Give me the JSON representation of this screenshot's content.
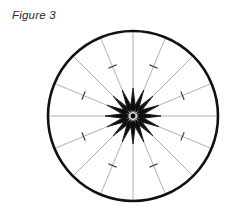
{
  "figure": {
    "caption": "Figure 3",
    "canvas": {
      "width": 236,
      "height": 219,
      "background": "#ffffff"
    },
    "circle": {
      "center_x": 133,
      "center_y": 116,
      "radius": 85,
      "stroke_color": "#101010",
      "stroke_width": 2.6,
      "fill": "none"
    },
    "spokes": {
      "count": 16,
      "angle_step_degrees": 22.5,
      "start_angle_degrees": -90,
      "stroke_color": "#8e8e8e",
      "stroke_width": 0.7,
      "inner_radius": 0,
      "outer_radius": 85
    },
    "ticks": {
      "count": 8,
      "on_spoke_indices": [
        1,
        3,
        5,
        7,
        9,
        11,
        13,
        15
      ],
      "radius_fraction": 0.63,
      "length": 9,
      "stroke_color": "#2a2a2a",
      "stroke_width": 1.1,
      "orientation": "perpendicular-to-spoke"
    },
    "star": {
      "points": 16,
      "outer_radius": 28,
      "inner_radius": 11,
      "rings": 7,
      "ring_scale_step": 0.86,
      "fill": "none",
      "stroke_color": "#0a0a0a",
      "stroke_width": 0.85,
      "hub_radius": 2.4,
      "hub_fill": "#0a0a0a"
    }
  }
}
